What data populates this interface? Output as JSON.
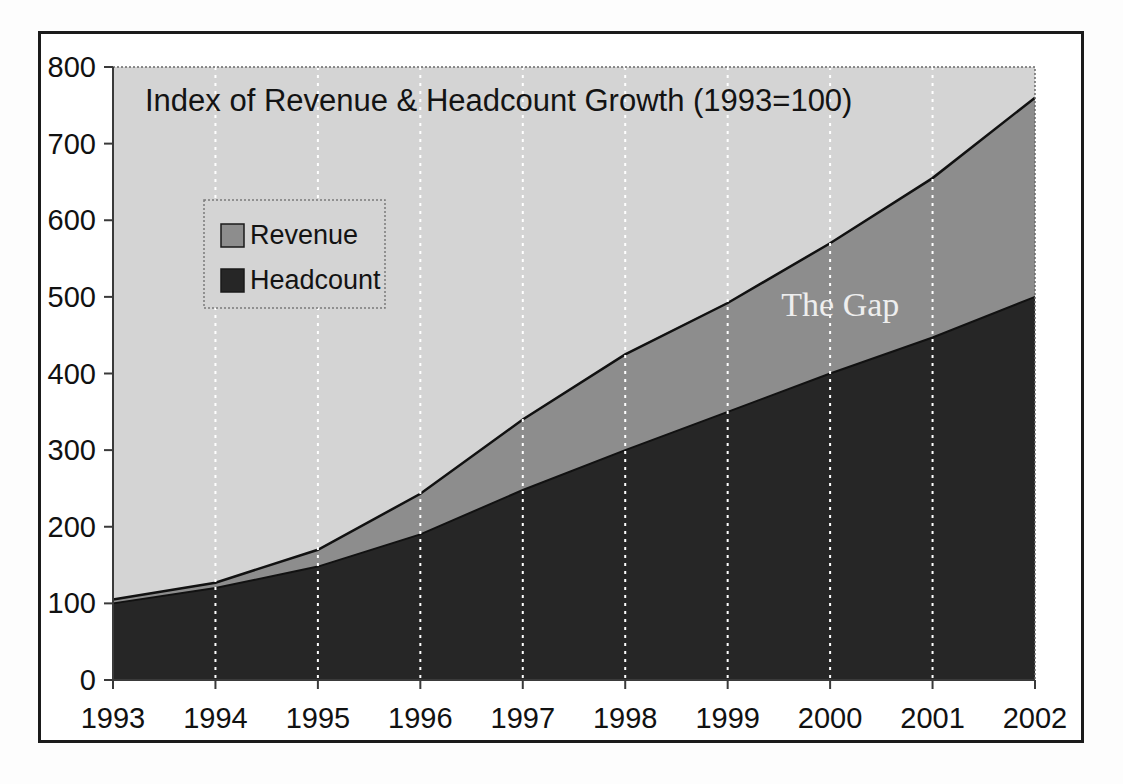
{
  "figure": {
    "background_color": "#fdfdfd",
    "frame_border_color": "#1b1b1b",
    "plot_background_color": "#d4d4d4"
  },
  "chart_data": {
    "type": "area",
    "title": "Index of Revenue & Headcount Growth (1993=100)",
    "xlabel": "",
    "ylabel": "",
    "categories": [
      "1993",
      "1994",
      "1995",
      "1996",
      "1997",
      "1998",
      "1999",
      "2000",
      "2001",
      "2002"
    ],
    "x": [
      1993,
      1994,
      1995,
      1996,
      1997,
      1998,
      1999,
      2000,
      2001,
      2002
    ],
    "series": [
      {
        "name": "Revenue",
        "color": "#8d8d8d",
        "values": [
          105,
          127,
          170,
          243,
          340,
          425,
          492,
          570,
          655,
          760
        ]
      },
      {
        "name": "Headcount",
        "color": "#262626",
        "values": [
          100,
          120,
          148,
          190,
          248,
          300,
          350,
          400,
          447,
          500
        ]
      }
    ],
    "stacked": false,
    "ylim": [
      0,
      800
    ],
    "yticks": [
      0,
      100,
      200,
      300,
      400,
      500,
      600,
      700,
      800
    ],
    "ytick_labels": [
      "0",
      "100",
      "200",
      "300",
      "400",
      "500",
      "600",
      "700",
      "800"
    ],
    "grid": "vertical-dotted-white",
    "legend": {
      "position": "upper-left-inside",
      "entries": [
        {
          "label": "Revenue",
          "swatch_color": "#8d8d8d"
        },
        {
          "label": "Headcount",
          "swatch_color": "#262626"
        }
      ]
    },
    "annotations": [
      {
        "text": "The Gap",
        "x": 2000.1,
        "y": 475,
        "color": "#eeeeee",
        "style": "serif"
      }
    ]
  }
}
